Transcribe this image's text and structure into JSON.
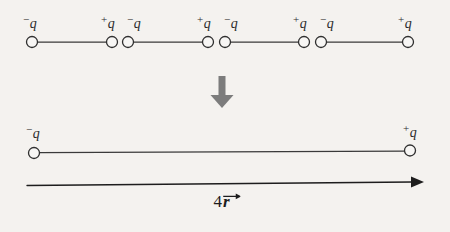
{
  "figure": {
    "background_color": "#f4f2ef",
    "ink_color": "#2b2b2b",
    "arrow_color": "#7c7c7c",
    "labels": {
      "negative": "−q",
      "positive": "+q",
      "negative_sign": "−",
      "positive_sign": "+",
      "charge_symbol": "q",
      "separation_number": "4",
      "separation_symbol": "r"
    },
    "top_row": {
      "name": "chain-of-four-dipoles",
      "baseline_y": 42,
      "circle_radius": 5.5,
      "label_y": 14,
      "charges": [
        {
          "sign": "−",
          "symbol": "q",
          "label": "−q",
          "x": 32,
          "polarity": "negative"
        },
        {
          "sign": "+",
          "symbol": "q",
          "label": "+q",
          "x": 112,
          "polarity": "positive"
        },
        {
          "sign": "−",
          "symbol": "q",
          "label": "−q",
          "x": 128,
          "polarity": "negative"
        },
        {
          "sign": "+",
          "symbol": "q",
          "label": "+q",
          "x": 208,
          "polarity": "positive"
        },
        {
          "sign": "−",
          "symbol": "q",
          "label": "−q",
          "x": 225,
          "polarity": "negative"
        },
        {
          "sign": "+",
          "symbol": "q",
          "label": "+q",
          "x": 304,
          "polarity": "positive"
        },
        {
          "sign": "−",
          "symbol": "q",
          "label": "−q",
          "x": 321,
          "polarity": "negative"
        },
        {
          "sign": "+",
          "symbol": "q",
          "label": "+q",
          "x": 408,
          "polarity": "positive"
        }
      ],
      "bonds": [
        {
          "from_x": 32,
          "to_x": 112
        },
        {
          "from_x": 128,
          "to_x": 208
        },
        {
          "from_x": 225,
          "to_x": 304
        },
        {
          "from_x": 321,
          "to_x": 408
        }
      ]
    },
    "transition_arrow": {
      "name": "downward-transition-arrow",
      "direction": "down",
      "x": 222,
      "y_start": 76,
      "y_end": 108,
      "color": "#7c7c7c"
    },
    "bottom_row": {
      "name": "single-equivalent-dipole",
      "baseline_y": 152,
      "circle_radius": 5.5,
      "label_y": 124,
      "charges": [
        {
          "sign": "−",
          "symbol": "q",
          "label": "−q",
          "x": 34,
          "polarity": "negative"
        },
        {
          "sign": "+",
          "symbol": "q",
          "label": "+q",
          "x": 410,
          "polarity": "positive"
        }
      ],
      "bond": {
        "from_x": 34,
        "to_x": 410
      }
    },
    "measure_arrow": {
      "name": "separation-measure-arrow",
      "direction": "right",
      "y": 184,
      "x_start": 27,
      "x_end": 422,
      "label": "4r",
      "label_x": 222,
      "label_y": 193
    }
  }
}
